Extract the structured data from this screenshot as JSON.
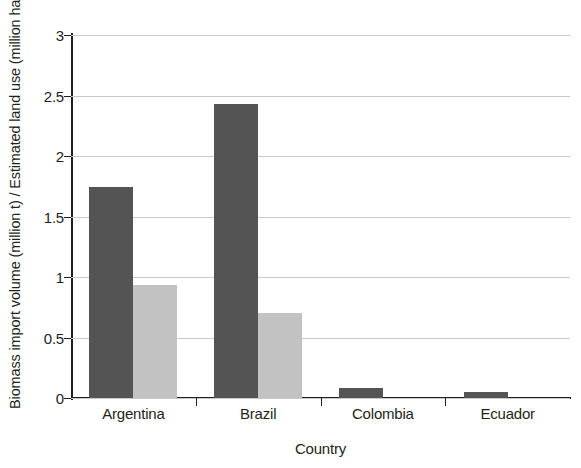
{
  "chart_data": {
    "type": "bar",
    "title": "",
    "subtitle": "",
    "xlabel": "Country",
    "ylabel": "Biomass import volume (million t) / Estimated land use (million ha)",
    "categories": [
      "Argentina",
      "Brazil",
      "Colombia",
      "Ecuador"
    ],
    "series": [
      {
        "name": "Biomass import volume (million t)",
        "color": "#545454",
        "values": [
          1.74,
          2.43,
          0.08,
          0.05
        ]
      },
      {
        "name": "Estimated land use (million ha)",
        "color": "#c2c2c2",
        "values": [
          0.93,
          0.7,
          0.0,
          0.0
        ]
      }
    ],
    "ylim": [
      0,
      3
    ],
    "ytick_labels": [
      "0",
      "0.5",
      "1",
      "1.5",
      "2",
      "2.5",
      "3"
    ],
    "ytick_values": [
      0,
      0.5,
      1,
      1.5,
      2,
      2.5,
      3
    ],
    "grid": "horizontal",
    "legend": "none",
    "annotations": []
  },
  "axes": {
    "y_title": "Biomass import volume (million t) / Estimated land use (million ha)",
    "x_title": "Country"
  }
}
